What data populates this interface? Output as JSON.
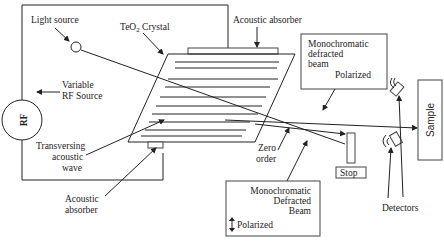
{
  "diagram": {
    "labels": {
      "light_source": "Light source",
      "crystal": "TeO",
      "crystal_sub": "2",
      "crystal_suffix": " Crystal",
      "acoustic_absorber_top": "Acoustic absorber",
      "rf": "RF",
      "variable_rf_1": "Variable",
      "variable_rf_2": "RF Source",
      "transversing_1": "Transversing",
      "transversing_2": "acoustic",
      "transversing_3": "wave",
      "acoustic_absorber_bottom_1": "Acoustic",
      "acoustic_absorber_bottom_2": "absorber",
      "zero_order_1": "Zero",
      "zero_order_2": "order",
      "stop": "Stop",
      "detectors": "Detectors",
      "sample": "Sample"
    },
    "beam_box_top": {
      "line1": "Monochromatic",
      "line2": "defracted",
      "line3": "beam",
      "polarization": "Polarized"
    },
    "beam_box_bottom": {
      "line1": "Monochromatic",
      "line2": "Defracted",
      "line3": "Beam",
      "polarization": "Polarized",
      "polarization_icon": "vertical-double-arrow"
    },
    "colors": {
      "line": "#222222",
      "box_border": "#444444",
      "background": "#ffffff"
    }
  }
}
